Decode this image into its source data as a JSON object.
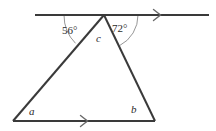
{
  "figure": {
    "name": "triangle-with-parallel-lines-angles",
    "stroke_color": "#3a3a3a",
    "arc_color": "#8a8a8a",
    "background_color": "#ffffff",
    "labels": {
      "angle_left_top": "56°",
      "angle_right_top": "72°",
      "vertex_apex": "c",
      "vertex_bottom_left": "a",
      "vertex_bottom_right": "b"
    },
    "geometry": {
      "top_line": {
        "x1": 35,
        "y1": 15,
        "x2": 209,
        "y2": 15
      },
      "bottom_line": {
        "x1": 13,
        "y1": 121,
        "x2": 155,
        "y2": 121
      },
      "apex": {
        "x": 104,
        "y": 15
      },
      "bottom_left": {
        "x": 13,
        "y": 121
      },
      "bottom_right": {
        "x": 155,
        "y": 121
      },
      "arrow_top": {
        "x": 158,
        "y": 15
      },
      "arrow_bottom": {
        "x": 85,
        "y": 121
      },
      "arc_left_radius": 40,
      "arc_right_radius": 34
    }
  }
}
